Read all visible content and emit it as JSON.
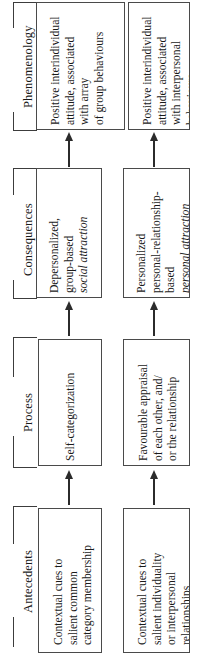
{
  "figure": {
    "type": "flow-diagram",
    "orientation": "rotated-90-ccw",
    "flow_direction": "Antecedents to Process to Consequences to Phenomenology",
    "rows": [
      "group-level pathway",
      "interpersonal pathway"
    ]
  },
  "sections": [
    {
      "id": "phenomenology",
      "label": "Phenomenology",
      "boxes": [
        {
          "id": "phenomenology-group",
          "lines": [
            {
              "text": "Positive interindividual",
              "italic": false
            },
            {
              "text": "attitude, associated",
              "italic": false
            },
            {
              "text": "with array",
              "italic": false
            },
            {
              "text": "of group behaviours",
              "italic": false
            }
          ]
        },
        {
          "id": "phenomenology-interpersonal",
          "lines": [
            {
              "text": "Positive interindividual",
              "italic": false
            },
            {
              "text": "attitude, associated",
              "italic": false
            },
            {
              "text": "with interpersonal",
              "italic": false
            },
            {
              "text": "behaviours",
              "italic": false
            }
          ]
        }
      ]
    },
    {
      "id": "consequences",
      "label": "Consequences",
      "boxes": [
        {
          "id": "consequences-group",
          "lines": [
            {
              "text": "Depersonalized,",
              "italic": false
            },
            {
              "text": "group-based",
              "italic": false
            },
            {
              "text": "social attraction",
              "italic": true
            }
          ]
        },
        {
          "id": "consequences-interpersonal",
          "lines": [
            {
              "text": "Personalized",
              "italic": false
            },
            {
              "text": "personal-relationship-",
              "italic": false
            },
            {
              "text": "based",
              "italic": false
            },
            {
              "text": "personal attraction",
              "italic": true
            }
          ]
        }
      ]
    },
    {
      "id": "process",
      "label": "Process",
      "boxes": [
        {
          "id": "process-group",
          "lines": [
            {
              "text": "Self-categorization",
              "italic": false
            }
          ]
        },
        {
          "id": "process-interpersonal",
          "lines": [
            {
              "text": "Favourable appraisal",
              "italic": false
            },
            {
              "text": "of each other, and/",
              "italic": false
            },
            {
              "text": "or the relationship",
              "italic": false
            }
          ]
        }
      ]
    },
    {
      "id": "antecedents",
      "label": "Antecedents",
      "boxes": [
        {
          "id": "antecedents-group",
          "lines": [
            {
              "text": "Contextual cues to",
              "italic": false
            },
            {
              "text": "salient common",
              "italic": false
            },
            {
              "text": "category membership",
              "italic": false
            }
          ]
        },
        {
          "id": "antecedents-interpersonal",
          "lines": [
            {
              "text": "Contextual cues to",
              "italic": false
            },
            {
              "text": "salient individuality",
              "italic": false
            },
            {
              "text": "or interpersonal",
              "italic": false
            },
            {
              "text": "relationships",
              "italic": false
            }
          ]
        }
      ]
    }
  ],
  "arrows": [
    {
      "id": "arrow-antecedents-to-process-group",
      "direction": "up"
    },
    {
      "id": "arrow-antecedents-to-process-interpersonal",
      "direction": "up"
    },
    {
      "id": "arrow-process-to-consequences-group",
      "direction": "up"
    },
    {
      "id": "arrow-process-to-consequences-interpersonal",
      "direction": "up"
    },
    {
      "id": "arrow-consequences-to-phenomenology-group",
      "direction": "up"
    },
    {
      "id": "arrow-consequences-to-phenomenology-interpersonal",
      "direction": "up"
    }
  ],
  "colors": {
    "background": "#ffffff",
    "box_border": "#4a4a4a",
    "bracket_line": "#3c3c3c",
    "arrow": "#2b2b2b",
    "text": "#1a1a1a"
  }
}
